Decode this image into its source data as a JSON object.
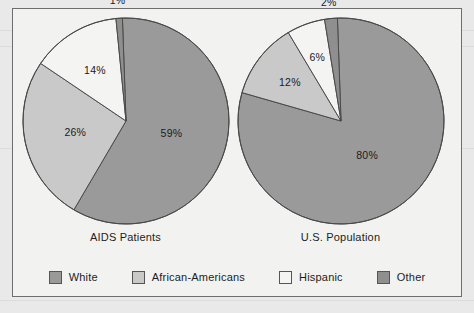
{
  "figure": {
    "background_color": "#f2f2f1",
    "border_color": "#6e6e6e"
  },
  "legend": {
    "position": "bottom",
    "items": [
      {
        "label": "White",
        "color": "#9a9a9a"
      },
      {
        "label": "African-Americans",
        "color": "#c9c9c9"
      },
      {
        "label": "Hispanic",
        "color": "#f4f4f2"
      },
      {
        "label": "Other",
        "color": "#8f8f8f"
      }
    ]
  },
  "chart_data": [
    {
      "type": "pie",
      "title": "AIDS Patients",
      "categories": [
        "White",
        "African-Americans",
        "Hispanic",
        "Other"
      ],
      "values": [
        59,
        26,
        14,
        1
      ],
      "colors": [
        "#9a9a9a",
        "#c9c9c9",
        "#f4f4f2",
        "#8f8f8f"
      ],
      "labels": [
        "59%",
        "26%",
        "14%",
        "1%"
      ],
      "units": "percent",
      "legend": "bottom",
      "grid": false
    },
    {
      "type": "pie",
      "title": "U.S. Population",
      "categories": [
        "White",
        "African-Americans",
        "Hispanic",
        "Other"
      ],
      "values": [
        80,
        12,
        6,
        2
      ],
      "colors": [
        "#9a9a9a",
        "#c9c9c9",
        "#f4f4f2",
        "#8f8f8f"
      ],
      "labels": [
        "80%",
        "12%",
        "6%",
        "2%"
      ],
      "units": "percent",
      "legend": "bottom",
      "grid": false
    }
  ]
}
